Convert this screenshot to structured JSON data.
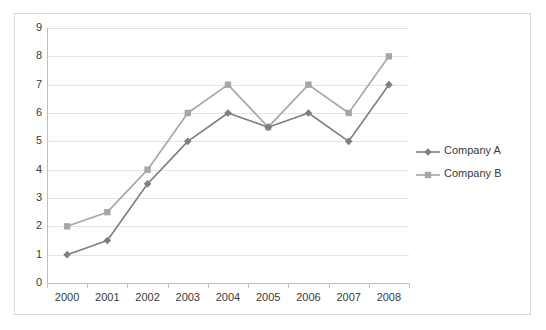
{
  "chart_data": {
    "type": "line",
    "title": "",
    "xlabel": "",
    "ylabel": "",
    "categories": [
      "2000",
      "2001",
      "2002",
      "2003",
      "2004",
      "2005",
      "2006",
      "2007",
      "2008"
    ],
    "series": [
      {
        "name": "Company A",
        "color": "#7f7f7f",
        "marker": "diamond",
        "values": [
          1,
          1.5,
          3.5,
          5,
          6,
          5.5,
          6,
          5,
          7
        ]
      },
      {
        "name": "Company B",
        "color": "#a6a6a6",
        "marker": "square",
        "values": [
          2,
          2.5,
          4,
          6,
          7,
          5.5,
          7,
          6,
          8
        ]
      }
    ],
    "ylim": [
      0,
      9
    ],
    "y_ticks": [
      0,
      1,
      2,
      3,
      4,
      5,
      6,
      7,
      8,
      9
    ],
    "y_tick_labels": [
      "0",
      "1",
      "2",
      "3",
      "4",
      "5",
      "6",
      "7",
      "8",
      "9"
    ],
    "grid": true,
    "grid_color": "#e4e4e4",
    "axis_color": "#bfbfbf",
    "legend_position": "right",
    "background": "#ffffff",
    "border_color": "#d9d9d9"
  }
}
